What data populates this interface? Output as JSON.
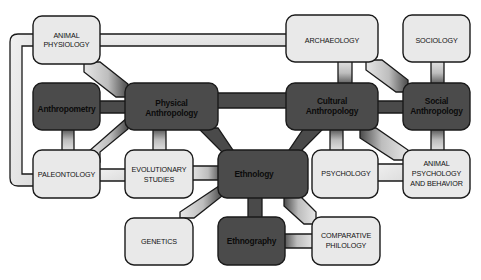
{
  "diagram": {
    "nodes": [
      {
        "id": "animal-physiology",
        "lines": [
          "ANIMAL",
          "PHYSIOLOGY"
        ],
        "style": "light"
      },
      {
        "id": "archaeology",
        "lines": [
          "ARCHAEOLOGY"
        ],
        "style": "light"
      },
      {
        "id": "sociology",
        "lines": [
          "SOCIOLOGY"
        ],
        "style": "light"
      },
      {
        "id": "anthropometry",
        "lines": [
          "Anthropometry"
        ],
        "style": "dark"
      },
      {
        "id": "physical-anthropology",
        "lines": [
          "Physical",
          "Anthropology"
        ],
        "style": "dark"
      },
      {
        "id": "cultural-anthropology",
        "lines": [
          "Cultural",
          "Anthropology"
        ],
        "style": "dark"
      },
      {
        "id": "social-anthropology",
        "lines": [
          "Social",
          "Anthropology"
        ],
        "style": "dark"
      },
      {
        "id": "paleontology",
        "lines": [
          "PALEONTOLOGY"
        ],
        "style": "light"
      },
      {
        "id": "evolutionary-studies",
        "lines": [
          "EVOLUTIONARY",
          "STUDIES"
        ],
        "style": "light"
      },
      {
        "id": "ethnology",
        "lines": [
          "Ethnology"
        ],
        "style": "dark"
      },
      {
        "id": "psychology",
        "lines": [
          "PSYCHOLOGY"
        ],
        "style": "light"
      },
      {
        "id": "animal-psychology",
        "lines": [
          "ANIMAL",
          "PSYCHOLOGY",
          "AND BEHAVIOR"
        ],
        "style": "light"
      },
      {
        "id": "genetics",
        "lines": [
          "GENETICS"
        ],
        "style": "light"
      },
      {
        "id": "ethnography",
        "lines": [
          "Ethnography"
        ],
        "style": "dark"
      },
      {
        "id": "comparative-philology",
        "lines": [
          "COMPARATIVE",
          "PHILOLOGY"
        ],
        "style": "light"
      }
    ],
    "edges": [
      [
        "animal-physiology",
        "archaeology"
      ],
      [
        "animal-physiology",
        "paleontology"
      ],
      [
        "animal-physiology",
        "physical-anthropology"
      ],
      [
        "anthropometry",
        "physical-anthropology"
      ],
      [
        "anthropometry",
        "paleontology"
      ],
      [
        "physical-anthropology",
        "paleontology"
      ],
      [
        "physical-anthropology",
        "evolutionary-studies"
      ],
      [
        "physical-anthropology",
        "cultural-anthropology"
      ],
      [
        "physical-anthropology",
        "ethnology"
      ],
      [
        "paleontology",
        "evolutionary-studies"
      ],
      [
        "evolutionary-studies",
        "ethnology"
      ],
      [
        "archaeology",
        "cultural-anthropology"
      ],
      [
        "archaeology",
        "social-anthropology"
      ],
      [
        "sociology",
        "social-anthropology"
      ],
      [
        "cultural-anthropology",
        "social-anthropology"
      ],
      [
        "cultural-anthropology",
        "ethnology"
      ],
      [
        "cultural-anthropology",
        "psychology"
      ],
      [
        "cultural-anthropology",
        "animal-psychology"
      ],
      [
        "social-anthropology",
        "animal-psychology"
      ],
      [
        "psychology",
        "animal-psychology"
      ],
      [
        "ethnology",
        "genetics"
      ],
      [
        "ethnology",
        "ethnography"
      ],
      [
        "ethnology",
        "comparative-philology"
      ],
      [
        "ethnography",
        "comparative-philology"
      ]
    ]
  }
}
